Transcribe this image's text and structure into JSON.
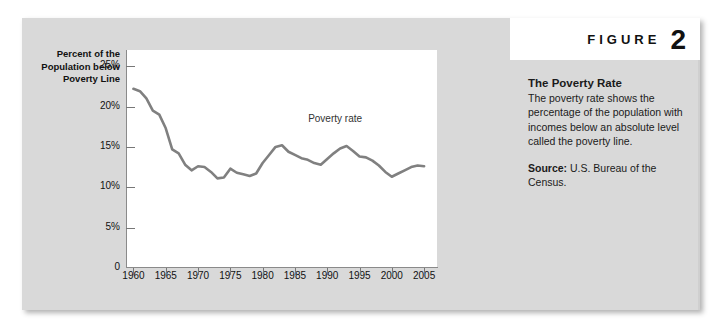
{
  "figure": {
    "word": "FIGURE",
    "number": "2"
  },
  "caption": {
    "title": "The Poverty Rate",
    "body": "The poverty rate shows the percentage of the population with incomes below an absolute level called the poverty line.",
    "source_label": "Source:",
    "source_text": " U.S. Bureau of the Census."
  },
  "colors": {
    "panel": "#d9d9d9",
    "plot_background": "#ffffff",
    "line": "#808080",
    "axis": "#8a8a8a",
    "text": "#1b1b1b"
  },
  "chart_data": {
    "type": "line",
    "title": "The Poverty Rate",
    "xlabel": "",
    "ylabel": "Percent of the Population below Poverty Line",
    "xlim": [
      1959,
      2007
    ],
    "ylim": [
      0,
      27
    ],
    "grid": false,
    "legend": "inline-label",
    "xticks": [
      1960,
      1965,
      1970,
      1975,
      1980,
      1985,
      1990,
      1995,
      2000,
      2005
    ],
    "xticklabels": [
      "1960",
      "1965",
      "1970",
      "1975",
      "1980",
      "1985",
      "1990",
      "1995",
      "2000",
      "2005"
    ],
    "yticks": [
      0,
      5,
      10,
      15,
      20,
      25
    ],
    "yticklabels": [
      "0",
      "5%",
      "10%",
      "15%",
      "20%",
      "25%"
    ],
    "annotations": [
      {
        "text": "Poverty rate",
        "x": 1992,
        "y": 18.5
      }
    ],
    "series": [
      {
        "name": "Poverty rate",
        "x": [
          1960,
          1961,
          1962,
          1963,
          1964,
          1965,
          1966,
          1967,
          1968,
          1969,
          1970,
          1971,
          1972,
          1973,
          1974,
          1975,
          1976,
          1977,
          1978,
          1979,
          1980,
          1981,
          1982,
          1983,
          1984,
          1985,
          1986,
          1987,
          1988,
          1989,
          1990,
          1991,
          1992,
          1993,
          1994,
          1995,
          1996,
          1997,
          1998,
          1999,
          2000,
          2001,
          2002,
          2003,
          2004,
          2005
        ],
        "values": [
          22.2,
          21.9,
          21.0,
          19.5,
          19.0,
          17.3,
          14.7,
          14.2,
          12.8,
          12.1,
          12.6,
          12.5,
          11.9,
          11.1,
          11.2,
          12.3,
          11.8,
          11.6,
          11.4,
          11.7,
          13.0,
          14.0,
          15.0,
          15.2,
          14.4,
          14.0,
          13.6,
          13.4,
          13.0,
          12.8,
          13.5,
          14.2,
          14.8,
          15.1,
          14.5,
          13.8,
          13.7,
          13.3,
          12.7,
          11.9,
          11.3,
          11.7,
          12.1,
          12.5,
          12.7,
          12.6
        ]
      }
    ]
  }
}
